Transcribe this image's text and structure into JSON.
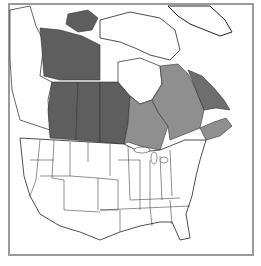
{
  "map": {
    "title": "",
    "region": "North America (Canada and contiguous United States)",
    "colors": {
      "dark_region": "#5e5e5e",
      "medium_region": "#8f8f8f",
      "labrador_region": "#6e6e6e",
      "land": "#ffffff",
      "borders": "#222222",
      "frame": "#9a9a9a"
    },
    "shaded_regions": [
      {
        "name": "Northwest Territories / western Nunavut",
        "shade": "dark"
      },
      {
        "name": "Victoria Island",
        "shade": "dark"
      },
      {
        "name": "Alberta",
        "shade": "dark"
      },
      {
        "name": "Saskatchewan",
        "shade": "dark"
      },
      {
        "name": "Manitoba",
        "shade": "dark"
      },
      {
        "name": "Ontario",
        "shade": "medium"
      },
      {
        "name": "Quebec",
        "shade": "medium"
      },
      {
        "name": "Labrador",
        "shade": "dark-medium"
      },
      {
        "name": "Maritime provinces",
        "shade": "medium"
      }
    ]
  }
}
